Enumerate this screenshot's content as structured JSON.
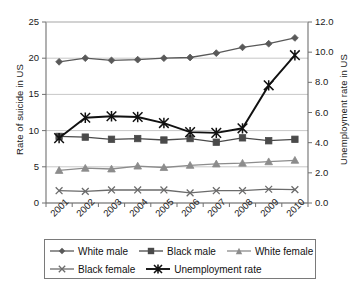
{
  "chart_data": {
    "type": "line",
    "title": "",
    "xlabel": "",
    "ylabel": "Rate of suicide in US",
    "ylabel_secondary": "Unemployment rate in US",
    "categories": [
      "2001",
      "2002",
      "2003",
      "2004",
      "2005",
      "2006",
      "2007",
      "2008",
      "2009",
      "2010"
    ],
    "ylim": [
      0,
      25
    ],
    "yticks": [
      "0",
      "5",
      "10",
      "15",
      "20",
      "25"
    ],
    "ylim_secondary": [
      0,
      12
    ],
    "yticks_secondary": [
      "0.0",
      "2.0",
      "4.0",
      "6.0",
      "8.0",
      "10.0",
      "12.0"
    ],
    "grid": true,
    "legend_position": "bottom",
    "series": [
      {
        "name": "White male",
        "axis": "left",
        "marker": "diamond",
        "color": "#595959",
        "values": [
          19.5,
          20.0,
          19.7,
          19.8,
          20.0,
          20.1,
          20.7,
          21.5,
          22.0,
          22.8
        ]
      },
      {
        "name": "Black male",
        "axis": "left",
        "marker": "square",
        "color": "#4a4a4a",
        "values": [
          9.2,
          9.1,
          8.8,
          8.9,
          8.7,
          8.9,
          8.4,
          9.0,
          8.6,
          8.8
        ]
      },
      {
        "name": "White female",
        "axis": "left",
        "marker": "triangle",
        "color": "#8c8c8c",
        "values": [
          4.5,
          4.8,
          4.7,
          5.1,
          4.9,
          5.2,
          5.4,
          5.5,
          5.7,
          5.9
        ]
      },
      {
        "name": "Black female",
        "axis": "left",
        "marker": "x",
        "color": "#6b6b6b",
        "values": [
          1.7,
          1.6,
          1.8,
          1.8,
          1.8,
          1.4,
          1.7,
          1.7,
          1.9,
          1.85
        ]
      },
      {
        "name": "Unemployment rate",
        "axis": "right",
        "marker": "asterisk",
        "color": "#111111",
        "values": [
          4.3,
          5.65,
          5.75,
          5.7,
          5.3,
          4.7,
          4.65,
          4.95,
          7.8,
          9.8
        ]
      }
    ]
  },
  "legend": {
    "items": [
      {
        "label": "White male",
        "marker": "diamond",
        "color": "#595959"
      },
      {
        "label": "Black male",
        "marker": "square",
        "color": "#4a4a4a"
      },
      {
        "label": "White female",
        "marker": "triangle",
        "color": "#8c8c8c"
      },
      {
        "label": "Black female",
        "marker": "x",
        "color": "#6b6b6b"
      },
      {
        "label": "Unemployment rate",
        "marker": "asterisk",
        "color": "#111111"
      }
    ]
  }
}
